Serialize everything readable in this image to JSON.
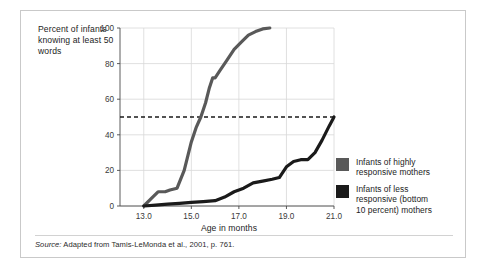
{
  "figure": {
    "ylabel": "Percent of infants knowing at least 50 words",
    "xlabel": "Age in months",
    "source_lead": "Source:",
    "source_text": " Adapted from Tamis-LeMonda et al., 2001, p. 761."
  },
  "legend": {
    "position": "right",
    "items": [
      {
        "label_line1": "Infants of highly",
        "label_line2": "responsive mothers",
        "label_line3": "",
        "color": "#595959",
        "name": "highly-responsive"
      },
      {
        "label_line1": "Infants of less",
        "label_line2": "responsive (bottom",
        "label_line3": "10 percent) mothers",
        "color": "#1a1a1a",
        "name": "less-responsive"
      }
    ]
  },
  "chart_data": {
    "type": "line",
    "title": "",
    "xlabel": "Age in months",
    "ylabel": "Percent of infants knowing at least 50 words",
    "xlim": [
      12.0,
      21.0
    ],
    "ylim": [
      0,
      100
    ],
    "xticks": [
      "13.0",
      "15.0",
      "17.0",
      "19.0",
      "21.0"
    ],
    "xtick_values": [
      13.0,
      15.0,
      17.0,
      19.0,
      21.0
    ],
    "yticks": [
      "0",
      "20",
      "40",
      "60",
      "80",
      "100"
    ],
    "ytick_values": [
      0,
      20,
      40,
      60,
      80,
      100
    ],
    "grid": true,
    "reference_line": {
      "y": 50,
      "style": "dashed",
      "color": "#1a1a1a"
    },
    "series": [
      {
        "name": "Infants of highly responsive mothers",
        "color": "#595959",
        "x": [
          13.0,
          13.3,
          13.6,
          13.9,
          14.1,
          14.4,
          14.7,
          15.0,
          15.2,
          15.4,
          15.6,
          15.75,
          15.9,
          16.0,
          16.2,
          16.5,
          16.8,
          17.1,
          17.4,
          17.7,
          18.0,
          18.3
        ],
        "y": [
          0,
          4,
          8,
          8,
          9,
          10,
          20,
          36,
          44,
          50,
          58,
          66,
          72,
          72,
          76,
          82,
          88,
          92,
          96,
          98,
          99.5,
          100
        ]
      },
      {
        "name": "Infants of less responsive (bottom 10 percent) mothers",
        "color": "#1a1a1a",
        "x": [
          13.0,
          13.5,
          14.0,
          14.5,
          15.0,
          15.5,
          16.0,
          16.4,
          16.8,
          17.2,
          17.6,
          18.0,
          18.4,
          18.7,
          19.0,
          19.3,
          19.6,
          19.9,
          20.2,
          20.5,
          20.8,
          21.0
        ],
        "y": [
          0,
          0.5,
          1,
          1.5,
          2,
          2.5,
          3,
          5,
          8,
          10,
          13,
          14,
          15,
          16,
          22,
          25,
          26,
          26,
          30,
          37,
          45,
          50
        ]
      }
    ]
  }
}
